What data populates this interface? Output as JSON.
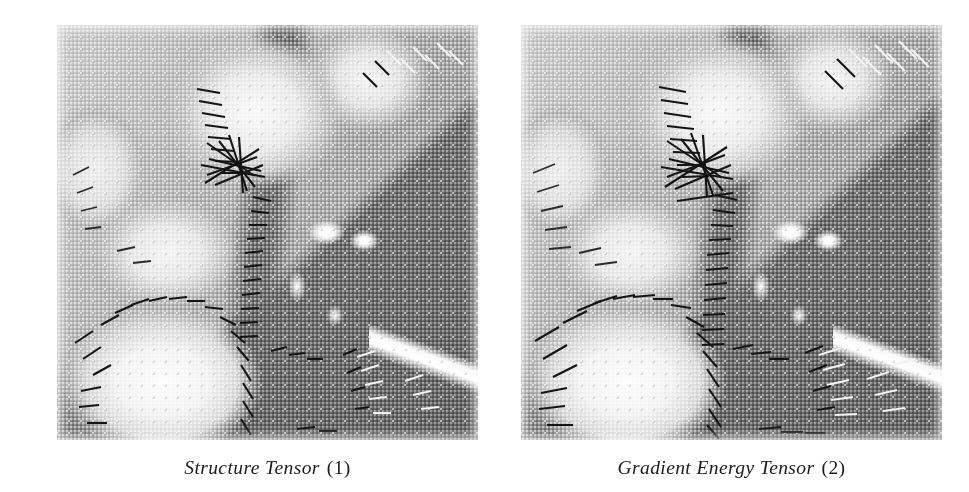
{
  "figure": {
    "background_color": "#ffffff",
    "layout": "two-panel-side-by-side",
    "panel_width_px": 421,
    "panel_height_px": 415
  },
  "panels": [
    {
      "id": "panel-1",
      "caption_name": "Structure Tensor",
      "caption_number": "(1)",
      "caption_full": "Structure Tensor (1)",
      "image_subject": "grayscale photograph of peppers with overlaid orientation tensor line segments",
      "overlay": "regular lattice of orientation markers; long line segments concentrated along object edges",
      "rendering": "halftone dithered grayscale print scan"
    },
    {
      "id": "panel-2",
      "caption_name": "Gradient Energy Tensor",
      "caption_number": "(2)",
      "caption_full": "Gradient Energy Tensor (2)",
      "image_subject": "grayscale photograph of peppers with overlaid orientation tensor line segments",
      "overlay": "regular lattice of orientation markers; longer, denser line segments along object edges",
      "rendering": "halftone dithered grayscale print scan"
    }
  ],
  "colors": {
    "page_background": "#ffffff",
    "caption_text": "#1b1b1b",
    "image_mid_gray": "#9a9a9a",
    "image_dark_gray": "#6c6c6c",
    "image_light_gray": "#f0f0f0",
    "vector_dark": "#141414",
    "vector_light": "#f4f4f4"
  }
}
